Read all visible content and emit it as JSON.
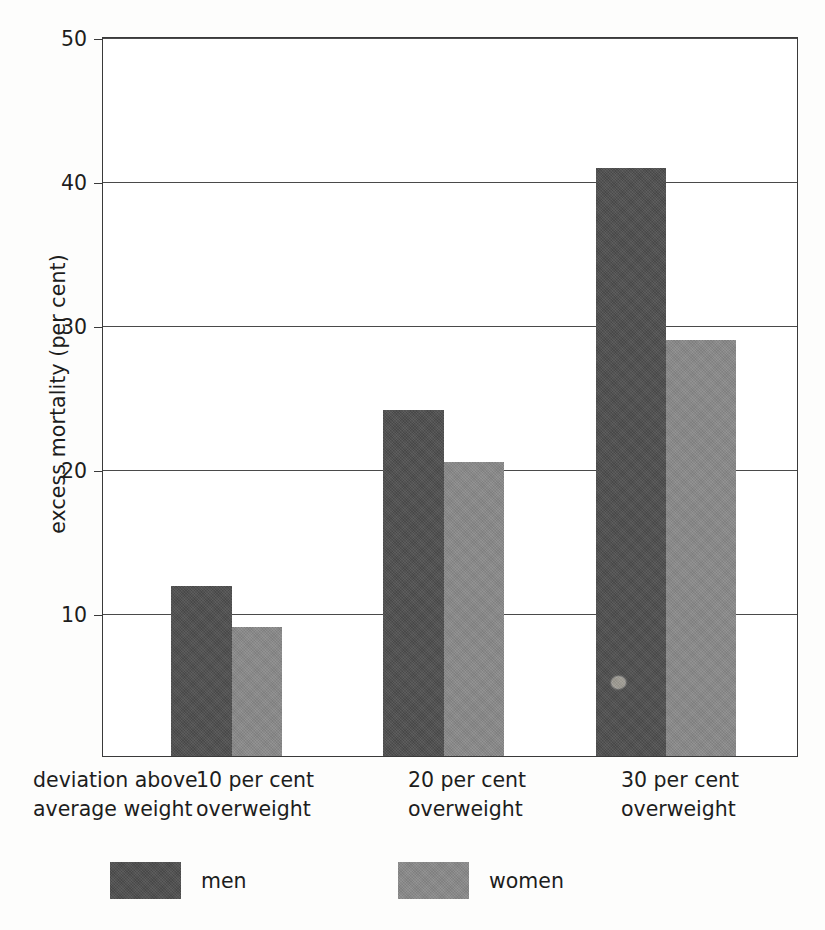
{
  "chart_data": {
    "type": "bar",
    "title": "",
    "subtitle": "",
    "xlabel": "deviation above average weight",
    "ylabel": "excess mortality (per cent)",
    "categories": [
      "10 per cent overweight",
      "20 per cent overweight",
      "30 per cent overweight"
    ],
    "category_lines": [
      [
        "10 per cent",
        "overweight"
      ],
      [
        "20 per cent",
        "overweight"
      ],
      [
        "30 per cent",
        "overweight"
      ]
    ],
    "series": [
      {
        "name": "men",
        "color": "#4d4d4d",
        "values": [
          12.4,
          25.3,
          43.0
        ]
      },
      {
        "name": "women",
        "color": "#888888",
        "values": [
          9.4,
          21.5,
          30.4
        ]
      }
    ],
    "ylim": [
      0,
      50
    ],
    "yticks": [
      10,
      20,
      30,
      40,
      50
    ],
    "ytick_labels": [
      "10",
      "20",
      "30",
      "40",
      "50"
    ],
    "grid": true,
    "legend_position": "bottom",
    "annotations": [
      "print blemish on third men bar"
    ]
  },
  "axis": {
    "y_title": "excess mortality (per cent)",
    "x_title_lines": [
      "deviation above",
      "average weight"
    ],
    "ticks": [
      {
        "value": 50,
        "label": "50"
      },
      {
        "value": 40,
        "label": "40"
      },
      {
        "value": 30,
        "label": "30"
      },
      {
        "value": 20,
        "label": "20"
      },
      {
        "value": 10,
        "label": "10"
      }
    ]
  },
  "groups": [
    {
      "label_line1": "10 per cent",
      "label_line2": "overweight",
      "men": 12.4,
      "women": 9.4
    },
    {
      "label_line1": "20 per cent",
      "label_line2": "overweight",
      "men": 25.3,
      "women": 21.5
    },
    {
      "label_line1": "30 per cent",
      "label_line2": "overweight",
      "men": 43.0,
      "women": 30.4
    }
  ],
  "legend": {
    "items": [
      {
        "label": "men",
        "color": "#4d4d4d"
      },
      {
        "label": "women",
        "color": "#888888"
      }
    ]
  }
}
